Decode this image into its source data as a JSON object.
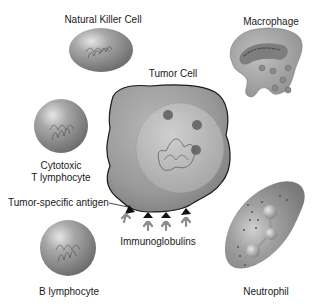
{
  "diagram": {
    "cells": [
      {
        "id": "natural-killer",
        "label": "Natural Killer Cell"
      },
      {
        "id": "macrophage",
        "label": "Macrophage"
      },
      {
        "id": "tumor",
        "label": "Tumor Cell"
      },
      {
        "id": "cytotoxic-t",
        "label_line1": "Cytotoxic",
        "label_line2": "T lymphocyte"
      },
      {
        "id": "b-lymphocyte",
        "label": "B lymphocyte"
      },
      {
        "id": "neutrophil",
        "label": "Neutrophil"
      }
    ],
    "annotations": [
      {
        "id": "tumor-antigen",
        "label": "Tumor-specific antigen"
      },
      {
        "id": "immunoglobulins",
        "label": "Immunoglobulins"
      }
    ],
    "colors": {
      "background": "#ffffff",
      "cell_fill": "#9a9a9a",
      "cell_highlight": "#d8d8d8",
      "cell_shadow": "#6e6e6e",
      "nucleus": "#b4b4b4",
      "outline": "#2a2a2a",
      "antibody": "#8c8c8c",
      "antigen": "#111111",
      "text": "#1a1a1a"
    }
  }
}
